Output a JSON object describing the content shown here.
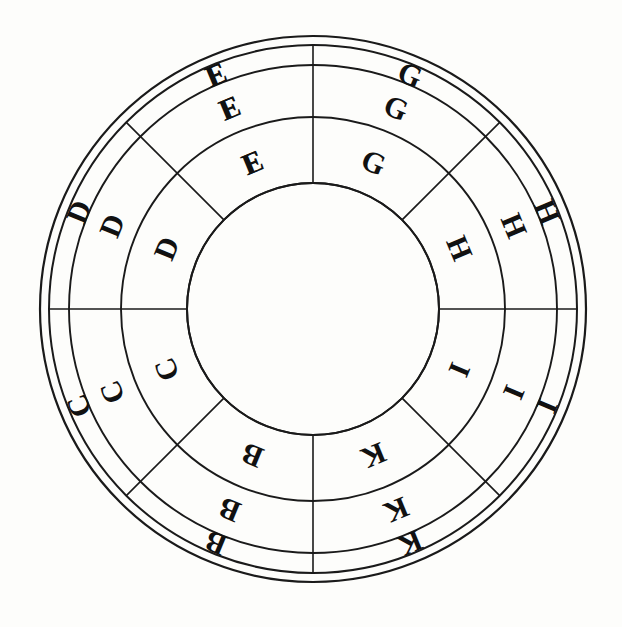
{
  "figure": {
    "kind": "concentric-lettered-wheel",
    "background_color": "#fdfdfb",
    "stroke_color": "#1a1a1a",
    "text_color": "#111111",
    "center": {
      "x": 313,
      "y": 309
    },
    "rim": {
      "outer_radius": 273,
      "inner_radius": 264
    },
    "rings": [
      {
        "name": "outer-ring",
        "outer_radius": 264,
        "inner_radius": 244,
        "label_radius": 254
      },
      {
        "name": "middle-ring",
        "outer_radius": 244,
        "inner_radius": 192,
        "label_radius": 218
      },
      {
        "name": "inner-ring",
        "outer_radius": 192,
        "inner_radius": 126,
        "label_radius": 159
      }
    ],
    "hub": {
      "name": "center-hub",
      "radius": 126
    },
    "sector_count": 8,
    "sector_span_degrees": 45,
    "first_sector_start_degrees": -90,
    "sector_labels": [
      "G",
      "H",
      "I",
      "K",
      "B",
      "C",
      "D",
      "E"
    ],
    "sector_center_degrees": [
      -67.5,
      -22.5,
      22.5,
      67.5,
      112.5,
      157.5,
      202.5,
      247.5
    ],
    "cells": [
      {
        "sector": 0,
        "ring": 0,
        "letter": "G"
      },
      {
        "sector": 0,
        "ring": 1,
        "letter": "G"
      },
      {
        "sector": 0,
        "ring": 2,
        "letter": "G"
      },
      {
        "sector": 1,
        "ring": 0,
        "letter": "H"
      },
      {
        "sector": 1,
        "ring": 1,
        "letter": "H"
      },
      {
        "sector": 1,
        "ring": 2,
        "letter": "H"
      },
      {
        "sector": 2,
        "ring": 0,
        "letter": "I"
      },
      {
        "sector": 2,
        "ring": 1,
        "letter": "I"
      },
      {
        "sector": 2,
        "ring": 2,
        "letter": "I"
      },
      {
        "sector": 3,
        "ring": 0,
        "letter": "K"
      },
      {
        "sector": 3,
        "ring": 1,
        "letter": "K"
      },
      {
        "sector": 3,
        "ring": 2,
        "letter": "K"
      },
      {
        "sector": 4,
        "ring": 0,
        "letter": "B"
      },
      {
        "sector": 4,
        "ring": 1,
        "letter": "B"
      },
      {
        "sector": 4,
        "ring": 2,
        "letter": "B"
      },
      {
        "sector": 5,
        "ring": 0,
        "letter": "C"
      },
      {
        "sector": 5,
        "ring": 1,
        "letter": "C"
      },
      {
        "sector": 5,
        "ring": 2,
        "letter": "C"
      },
      {
        "sector": 6,
        "ring": 0,
        "letter": "D"
      },
      {
        "sector": 6,
        "ring": 1,
        "letter": "D"
      },
      {
        "sector": 6,
        "ring": 2,
        "letter": "D"
      },
      {
        "sector": 7,
        "ring": 0,
        "letter": "E"
      },
      {
        "sector": 7,
        "ring": 1,
        "letter": "E"
      },
      {
        "sector": 7,
        "ring": 2,
        "letter": "E"
      },
      {
        "sector": 8,
        "ring": 0,
        "letter": "F"
      },
      {
        "sector": 8,
        "ring": 1,
        "letter": "F"
      },
      {
        "sector": 8,
        "ring": 2,
        "letter": "F"
      }
    ],
    "label_font_sizes": [
      31,
      28,
      25
    ],
    "note_sectors_drawn": 8
  }
}
